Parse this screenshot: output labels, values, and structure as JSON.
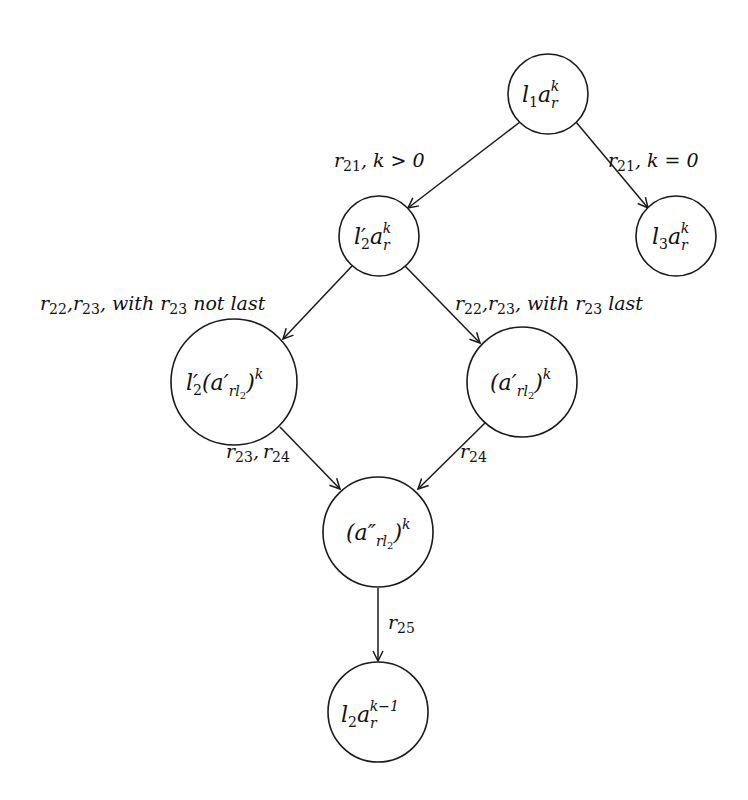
{
  "diagram": {
    "type": "state-transition-graph",
    "nodes": [
      {
        "id": "n1",
        "label": "l1 a_r^k",
        "main": "l",
        "sub1": "1",
        "main2": "a",
        "sub2": "r",
        "sup": "k",
        "cx": 548,
        "cy": 94,
        "r": 40
      },
      {
        "id": "n2",
        "label": "l2' a_r^k",
        "main": "l′",
        "sub1": "2",
        "main2": "a",
        "sub2": "r",
        "sup": "k",
        "cx": 379,
        "cy": 236,
        "r": 40
      },
      {
        "id": "n3",
        "label": "l3 a_r^k",
        "main": "l",
        "sub1": "3",
        "main2": "a",
        "sub2": "r",
        "sup": "k",
        "cx": 676,
        "cy": 236,
        "r": 40
      },
      {
        "id": "n4",
        "label": "l2'(a'_{rl2})^k",
        "pre": "l′",
        "pre_sub": "2",
        "open": "(a′",
        "sub": "rl",
        "subsub": "2",
        "close": ")",
        "sup": "k",
        "cx": 234,
        "cy": 382,
        "r": 63
      },
      {
        "id": "n5",
        "label": "(a'_{rl2})^k",
        "open": "(a′",
        "sub": "rl",
        "subsub": "2",
        "close": ")",
        "sup": "k",
        "cx": 522,
        "cy": 382,
        "r": 55
      },
      {
        "id": "n6",
        "label": "(a''_{rl2})^k",
        "open": "(a″",
        "sub": "rl",
        "subsub": "2",
        "close": ")",
        "sup": "k",
        "cx": 378,
        "cy": 532,
        "r": 55
      },
      {
        "id": "n7",
        "label": "l2 a_r^{k-1}",
        "main": "l",
        "sub1": "2",
        "main2": "a",
        "sub2": "r",
        "sup": "k−1",
        "cx": 378,
        "cy": 712,
        "r": 50
      }
    ],
    "edges": [
      {
        "from": "n1",
        "to": "n2",
        "label": "r21,  k > 0",
        "r": "r",
        "rsub": "21",
        "rest": ",  k > 0"
      },
      {
        "from": "n1",
        "to": "n3",
        "label": "r21,  k = 0",
        "r": "r",
        "rsub": "21",
        "rest": ",  k = 0"
      },
      {
        "from": "n2",
        "to": "n4",
        "label": "r22, r23, with r23 not last"
      },
      {
        "from": "n2",
        "to": "n5",
        "label": "r22, r23, with r23 last"
      },
      {
        "from": "n4",
        "to": "n6",
        "label": "r23, r24"
      },
      {
        "from": "n5",
        "to": "n6",
        "label": "r24"
      },
      {
        "from": "n6",
        "to": "n7",
        "label": "r25"
      }
    ],
    "text": {
      "r": "r",
      "s21": "21",
      "s22": "22",
      "s23": "23",
      "s24": "24",
      "s25": "25",
      "k_gt_0": ",  k > 0",
      "k_eq_0": ",  k = 0",
      "comma": ",",
      "with": ", with ",
      "not_last": " not last",
      "last": " last"
    }
  }
}
